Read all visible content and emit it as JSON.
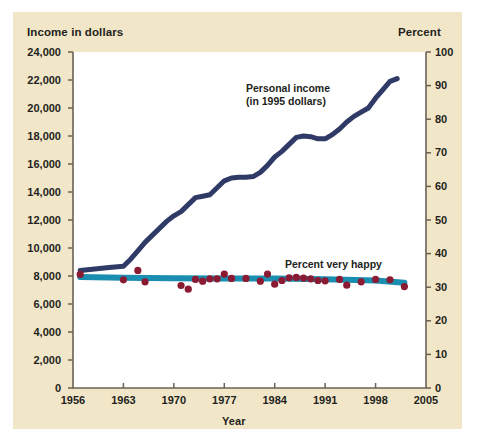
{
  "figure": {
    "background_color": "#f2e6c8",
    "plot_background_color": "#ffffff"
  },
  "axis_titles": {
    "left": "Income in dollars",
    "right": "Percent",
    "bottom": "Year"
  },
  "annotations": {
    "income_line_1": "Personal income",
    "income_line_2": "(in 1995 dollars)",
    "happy_line": "Percent very happy"
  },
  "chart_data": {
    "type": "line",
    "title": "",
    "subtitle": "",
    "xlabel": "Year",
    "ylabel": "Income in dollars",
    "ylabel_right": "Percent",
    "xlim": [
      1956,
      2005
    ],
    "ylim_left": [
      0,
      24000
    ],
    "ylim_right": [
      0,
      100
    ],
    "grid": false,
    "legend_position": "inline-annotations",
    "xticks": [
      1956,
      1963,
      1970,
      1977,
      1984,
      1991,
      1998,
      2005
    ],
    "xtick_labels": [
      "1956",
      "1963",
      "1970",
      "1977",
      "1984",
      "1991",
      "1998",
      "2005"
    ],
    "yticks_left": [
      0,
      2000,
      4000,
      6000,
      8000,
      10000,
      12000,
      14000,
      16000,
      18000,
      20000,
      22000,
      24000
    ],
    "ytick_labels_left": [
      "0",
      "2,000",
      "4,000",
      "6,000",
      "8,000",
      "10,000",
      "12,000",
      "14,000",
      "16,000",
      "18,000",
      "20,000",
      "22,000",
      "24,000"
    ],
    "yticks_right": [
      0,
      10,
      20,
      30,
      40,
      50,
      60,
      70,
      80,
      90,
      100
    ],
    "ytick_labels_right": [
      "0",
      "10",
      "20",
      "30",
      "40",
      "50",
      "60",
      "70",
      "80",
      "90",
      "100"
    ],
    "series": [
      {
        "name": "Personal income (in 1995 dollars)",
        "axis": "left",
        "type": "line",
        "color": "#2f3a66",
        "linewidth": 5,
        "x": [
          1957,
          1959,
          1961,
          1963,
          1964,
          1965,
          1966,
          1967,
          1968,
          1969,
          1970,
          1971,
          1972,
          1973,
          1974,
          1975,
          1976,
          1977,
          1978,
          1979,
          1980,
          1981,
          1982,
          1983,
          1984,
          1985,
          1986,
          1987,
          1988,
          1989,
          1990,
          1991,
          1992,
          1993,
          1994,
          1995,
          1996,
          1997,
          1998,
          1999,
          2000,
          2001
        ],
        "y": [
          8400,
          8500,
          8600,
          8700,
          9200,
          9800,
          10400,
          10900,
          11400,
          11900,
          12300,
          12600,
          13100,
          13600,
          13700,
          13800,
          14300,
          14800,
          15000,
          15050,
          15050,
          15100,
          15400,
          15900,
          16500,
          16900,
          17400,
          17900,
          18000,
          17950,
          17800,
          17800,
          18100,
          18500,
          19000,
          19400,
          19700,
          20000,
          20700,
          21300,
          21900,
          22100
        ]
      },
      {
        "name": "Percent very happy (trend line)",
        "axis": "right",
        "type": "line",
        "color": "#1a8eb0",
        "linewidth": 6,
        "x": [
          1957,
          1963,
          1970,
          1977,
          1984,
          1991,
          1998,
          2002
        ],
        "y": [
          33.0,
          32.8,
          32.7,
          32.6,
          32.6,
          32.4,
          32.0,
          31.3
        ]
      },
      {
        "name": "Percent very happy (observations)",
        "axis": "right",
        "type": "scatter",
        "color": "#8b1a33",
        "marker_size": 6,
        "x": [
          1957,
          1963,
          1965,
          1966,
          1971,
          1972,
          1973,
          1974,
          1975,
          1976,
          1977,
          1978,
          1980,
          1982,
          1983,
          1984,
          1985,
          1986,
          1987,
          1988,
          1989,
          1990,
          1991,
          1993,
          1994,
          1996,
          1998,
          2000,
          2002
        ],
        "y": [
          33.8,
          32.2,
          35.0,
          31.6,
          30.5,
          29.4,
          32.3,
          31.8,
          32.5,
          32.5,
          33.9,
          32.6,
          32.6,
          31.8,
          33.9,
          30.9,
          32.0,
          32.8,
          32.9,
          32.7,
          32.5,
          32.0,
          31.9,
          32.3,
          30.6,
          31.6,
          32.3,
          32.2,
          30.2
        ]
      }
    ]
  }
}
